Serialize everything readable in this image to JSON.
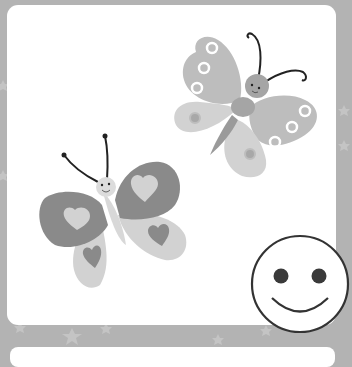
{
  "scene": {
    "description": "Grayscale illustration of two cartoon butterflies and a smiley face on a white rounded card with a starry gray border",
    "colors": {
      "border": "#b3b3b3",
      "card": "#ffffff",
      "star": "#c4c4c4",
      "wing_dark": "#8a8a8a",
      "wing_mid": "#bcbcbc",
      "wing_light": "#d0d0d0",
      "body_dark": "#9a9a9a",
      "outline": "#333333"
    },
    "elements": [
      "butterfly-top-right",
      "butterfly-bottom-left",
      "smiley-face"
    ]
  }
}
